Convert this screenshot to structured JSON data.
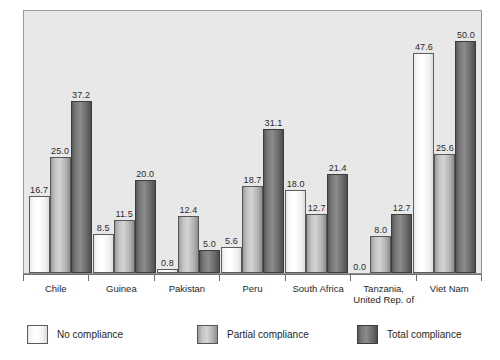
{
  "chart_data": {
    "type": "bar",
    "title": "",
    "subtitle": "",
    "xlabel": "",
    "ylabel": "",
    "ylim": [
      0,
      57
    ],
    "grid": false,
    "legend_position": "bottom",
    "categories": [
      "Chile",
      "Guinea",
      "Pakistan",
      "Peru",
      "South Africa",
      "Tanzania, United Rep. of",
      "Viet Nam"
    ],
    "category_lines": [
      [
        "Chile",
        ""
      ],
      [
        "Guinea",
        ""
      ],
      [
        "Pakistan",
        ""
      ],
      [
        "Peru",
        ""
      ],
      [
        "South Africa",
        ""
      ],
      [
        "Tanzania,",
        "United Rep. of"
      ],
      [
        "Viet Nam",
        ""
      ]
    ],
    "series": [
      {
        "name": "No compliance",
        "color": "#ffffff",
        "values": [
          16.7,
          8.5,
          0.8,
          5.6,
          18.0,
          0.0,
          47.6
        ],
        "labels": [
          "16.7",
          "8.5",
          "0.8",
          "5.6",
          "18.0",
          "0.0",
          "47.6"
        ]
      },
      {
        "name": "Partial compliance",
        "color": "#c0c0c0",
        "values": [
          25.0,
          11.5,
          12.4,
          18.7,
          12.7,
          8.0,
          25.6
        ],
        "labels": [
          "25.0",
          "11.5",
          "12.4",
          "18.7",
          "12.7",
          "8.0",
          "25.6"
        ]
      },
      {
        "name": "Total compliance",
        "color": "#6b6b6b",
        "values": [
          37.2,
          20.0,
          5.0,
          31.1,
          21.4,
          12.7,
          50.0
        ],
        "labels": [
          "37.2",
          "20.0",
          "5.0",
          "31.1",
          "21.4",
          "12.7",
          "50.0"
        ]
      }
    ]
  },
  "legend": {
    "items": [
      {
        "label": "No compliance"
      },
      {
        "label": "Partial compliance"
      },
      {
        "label": "Total compliance"
      }
    ]
  }
}
